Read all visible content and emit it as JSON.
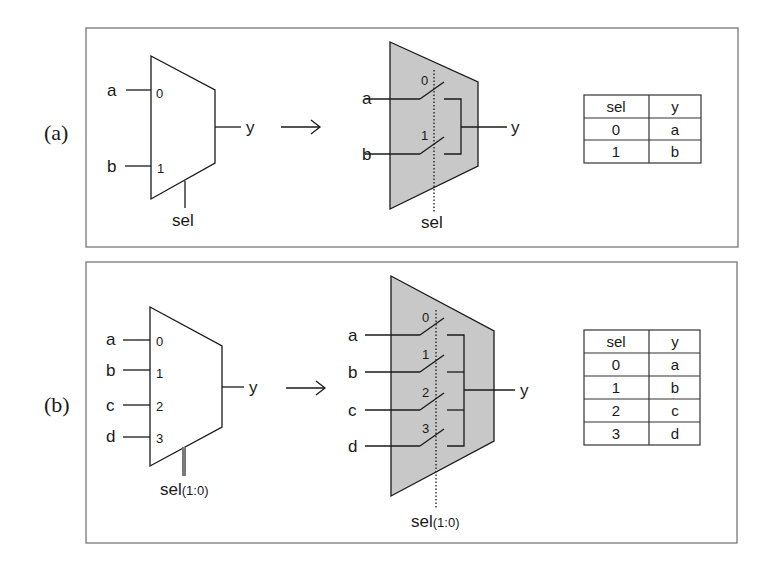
{
  "figure": {
    "colors": {
      "mux_fill_gray": "#c8c8c8",
      "panel_border": "#6b6b6b",
      "bus_color": "#7a7a7a",
      "line": "#1a1a1a"
    },
    "panels": [
      {
        "label": "(a)",
        "symbol": {
          "inputs": [
            {
              "name": "a",
              "port": "0"
            },
            {
              "name": "b",
              "port": "1"
            }
          ],
          "output": "y",
          "select": "sel",
          "select_suffix": ""
        },
        "arrow": "→",
        "switch_model": {
          "inputs": [
            {
              "name": "a",
              "port": "0"
            },
            {
              "name": "b",
              "port": "1"
            }
          ],
          "output": "y",
          "select": "sel",
          "select_suffix": ""
        },
        "truth_table": {
          "headers": [
            "sel",
            "y"
          ],
          "rows": [
            [
              "0",
              "a"
            ],
            [
              "1",
              "b"
            ]
          ]
        }
      },
      {
        "label": "(b)",
        "symbol": {
          "inputs": [
            {
              "name": "a",
              "port": "0"
            },
            {
              "name": "b",
              "port": "1"
            },
            {
              "name": "c",
              "port": "2"
            },
            {
              "name": "d",
              "port": "3"
            }
          ],
          "output": "y",
          "select": "sel",
          "select_suffix": "(1:0)"
        },
        "arrow": "→",
        "switch_model": {
          "inputs": [
            {
              "name": "a",
              "port": "0"
            },
            {
              "name": "b",
              "port": "1"
            },
            {
              "name": "c",
              "port": "2"
            },
            {
              "name": "d",
              "port": "3"
            }
          ],
          "output": "y",
          "select": "sel",
          "select_suffix": "(1:0)"
        },
        "truth_table": {
          "headers": [
            "sel",
            "y"
          ],
          "rows": [
            [
              "0",
              "a"
            ],
            [
              "1",
              "b"
            ],
            [
              "2",
              "c"
            ],
            [
              "3",
              "d"
            ]
          ]
        }
      }
    ]
  }
}
